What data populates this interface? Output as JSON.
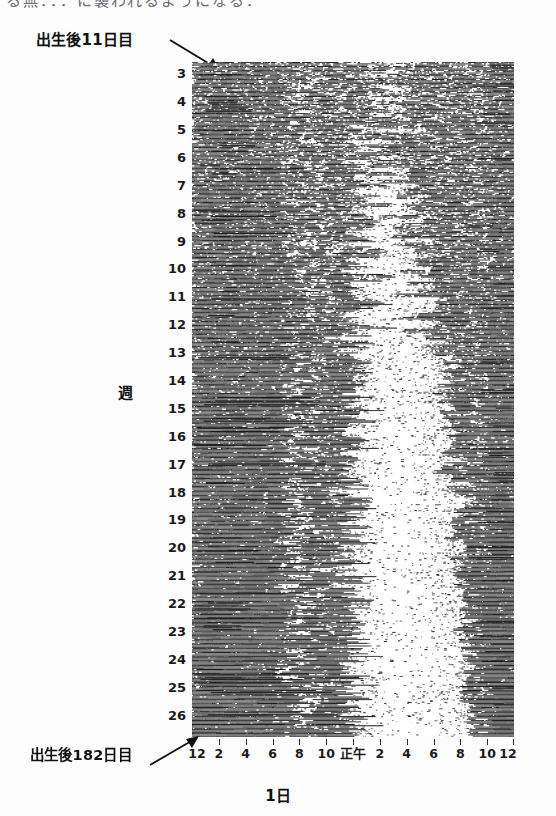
{
  "figure": {
    "top_cut_text": "る無．．．に襲われるようになる．",
    "y_axis_caption": "週",
    "x_axis_caption": "1日",
    "annotations": [
      {
        "name": "top",
        "text": "出生後11日目"
      },
      {
        "name": "bottom",
        "text": "出生後182日目"
      }
    ],
    "week_labels": [
      "3",
      "4",
      "5",
      "6",
      "7",
      "8",
      "9",
      "10",
      "11",
      "12",
      "13",
      "14",
      "15",
      "16",
      "17",
      "18",
      "19",
      "20",
      "21",
      "22",
      "23",
      "24",
      "25",
      "26"
    ],
    "hour_labels": [
      "12",
      "2",
      "4",
      "6",
      "8",
      "10",
      "正午",
      "2",
      "4",
      "6",
      "8",
      "10",
      "12"
    ]
  },
  "chart_data": {
    "type": "heatmap",
    "title": "",
    "subtitle": "",
    "xlabel": "1日",
    "ylabel": "週",
    "legend": [],
    "grid": false,
    "x": {
      "unit": "hour-of-day",
      "range_hours": [
        0,
        24
      ],
      "tick_hours": [
        0,
        2,
        4,
        6,
        8,
        10,
        12,
        14,
        16,
        18,
        20,
        22,
        24
      ],
      "tick_labels": [
        "12",
        "2",
        "4",
        "6",
        "8",
        "10",
        "正午",
        "2",
        "4",
        "6",
        "8",
        "10",
        "12"
      ],
      "midnight_label": "12",
      "noon_label": "正午"
    },
    "y": {
      "unit": "week-of-age",
      "range_weeks": [
        2.6,
        26.8
      ],
      "tick_weeks": [
        3,
        4,
        5,
        6,
        7,
        8,
        9,
        10,
        11,
        12,
        13,
        14,
        15,
        16,
        17,
        18,
        19,
        20,
        21,
        22,
        23,
        24,
        25,
        26
      ],
      "tick_labels": [
        "3",
        "4",
        "5",
        "6",
        "7",
        "8",
        "9",
        "10",
        "11",
        "12",
        "13",
        "14",
        "15",
        "16",
        "17",
        "18",
        "19",
        "20",
        "21",
        "22",
        "23",
        "24",
        "25",
        "26"
      ],
      "direction": "top-to-bottom increasing",
      "start_day_after_birth": 11,
      "end_day_after_birth": 182
    },
    "days_total": 172,
    "raster_rows": 172,
    "ink_color": "#1a1a1a",
    "background_color": "#ffffff",
    "pattern": {
      "early_weeks": "Activity and sleep bouts scattered across all 24 hours (ultradian, no day-night preference); raster nearly uniformly dark with short irregular white gaps.",
      "middle_weeks": "Sleep episodes begin clustering; a widening white band appears in the afternoon/evening sector.",
      "late_weeks": "Clear circadian consolidation: a broad continuous dark band from about midnight through morning and a large white (sleep) region centered roughly between noon and 20:00."
    },
    "series": [
      {
        "name": "consolidation_index_by_week",
        "week": [
          3,
          4,
          5,
          6,
          7,
          8,
          9,
          10,
          11,
          12,
          13,
          14,
          15,
          16,
          17,
          18,
          19,
          20,
          21,
          22,
          23,
          24,
          25,
          26
        ],
        "values": [
          0.06,
          0.08,
          0.1,
          0.12,
          0.15,
          0.18,
          0.21,
          0.25,
          0.29,
          0.33,
          0.37,
          0.41,
          0.45,
          0.5,
          0.55,
          0.59,
          0.64,
          0.69,
          0.74,
          0.79,
          0.84,
          0.89,
          0.93,
          0.97
        ]
      },
      {
        "name": "sleep_center_hour_by_week",
        "week": [
          3,
          4,
          5,
          6,
          7,
          8,
          9,
          10,
          11,
          12,
          13,
          14,
          15,
          16,
          17,
          18,
          19,
          20,
          21,
          22,
          23,
          24,
          25,
          26
        ],
        "values": [
          13.5,
          13.6,
          13.8,
          13.9,
          14.0,
          14.1,
          14.3,
          14.4,
          14.6,
          14.7,
          14.9,
          15.0,
          15.1,
          15.2,
          15.3,
          15.4,
          15.4,
          15.5,
          15.5,
          15.6,
          15.6,
          15.7,
          15.7,
          15.8
        ]
      },
      {
        "name": "sleep_halfwidth_hours_by_week",
        "week": [
          3,
          4,
          5,
          6,
          7,
          8,
          9,
          10,
          11,
          12,
          13,
          14,
          15,
          16,
          17,
          18,
          19,
          20,
          21,
          22,
          23,
          24,
          25,
          26
        ],
        "values": [
          0.4,
          0.6,
          0.8,
          1.0,
          1.3,
          1.6,
          1.9,
          2.2,
          2.5,
          2.8,
          3.1,
          3.4,
          3.6,
          3.8,
          4.0,
          4.1,
          4.2,
          4.3,
          4.4,
          4.4,
          4.5,
          4.5,
          4.6,
          4.6
        ]
      }
    ]
  }
}
